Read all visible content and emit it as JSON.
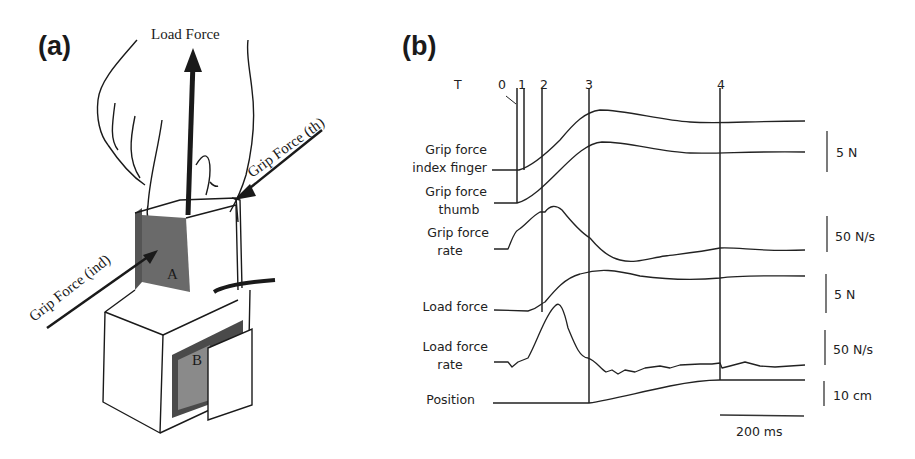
{
  "panel_a": {
    "label": "(a)",
    "arrows": {
      "load_force": "Load Force",
      "grip_force_thumb": "Grip Force (th)",
      "grip_force_index": "Grip Force (ind)"
    },
    "surfaces": {
      "a": "A",
      "b": "B"
    }
  },
  "panel_b": {
    "label": "(b)",
    "time_marker_label": "T",
    "time_markers": [
      "0",
      "1",
      "2",
      "3",
      "4"
    ],
    "traces": [
      {
        "label_line1": "Grip force",
        "label_line2": "index finger",
        "scale": "5 N"
      },
      {
        "label_line1": "Grip force",
        "label_line2": "thumb",
        "scale": ""
      },
      {
        "label_line1": "Grip force",
        "label_line2": "rate",
        "scale": "50 N/s"
      },
      {
        "label_line1": "Load force",
        "label_line2": "",
        "scale": "5 N"
      },
      {
        "label_line1": "Load force",
        "label_line2": "rate",
        "scale": "50 N/s"
      },
      {
        "label_line1": "Position",
        "label_line2": "",
        "scale": "10 cm"
      }
    ],
    "time_scale": "200 ms"
  }
}
